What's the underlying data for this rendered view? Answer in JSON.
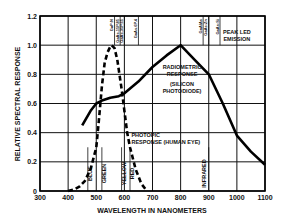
{
  "chart_data": {
    "type": "line",
    "title": "",
    "xlabel": "WAVELENGTH IN NANOMETERS",
    "ylabel": "RELATIVE SPECTRAL RESPONSE",
    "xlim": [
      300,
      1100
    ],
    "ylim": [
      0,
      1.2
    ],
    "xticks": [
      300,
      400,
      500,
      600,
      700,
      800,
      900,
      1000,
      1100
    ],
    "xtick_labels": [
      "300",
      "400",
      "500",
      "600",
      "700",
      "800",
      "900",
      "1000",
      "1100"
    ],
    "yticks": [
      0,
      0.2,
      0.4,
      0.6,
      0.8,
      1.0,
      1.2
    ],
    "ytick_labels": [
      "0",
      "0.2",
      "0.4",
      "0.6",
      "0.8",
      "1.0",
      "1.2"
    ],
    "grid": true,
    "series": [
      {
        "name": "PHOTOPIC RESPONSE (HUMAN EYE)",
        "style": "dashed",
        "x": [
          400,
          420,
          440,
          460,
          480,
          500,
          510,
          520,
          530,
          540,
          550,
          555,
          565,
          575,
          590,
          600,
          610,
          620,
          640,
          660,
          680
        ],
        "y": [
          0.0,
          0.01,
          0.03,
          0.07,
          0.15,
          0.3,
          0.5,
          0.72,
          0.88,
          0.95,
          0.99,
          1.0,
          0.98,
          0.9,
          0.7,
          0.55,
          0.4,
          0.3,
          0.15,
          0.05,
          0.0
        ]
      },
      {
        "name": "RADIOMETRIC RESPONSE (SILICON PHOTODIODE)",
        "style": "solid",
        "x": [
          450,
          480,
          500,
          520,
          550,
          580,
          600,
          650,
          700,
          750,
          800,
          850,
          900,
          950,
          1000,
          1050,
          1100
        ],
        "y": [
          0.45,
          0.55,
          0.6,
          0.62,
          0.64,
          0.65,
          0.67,
          0.75,
          0.85,
          0.93,
          1.0,
          0.9,
          0.8,
          0.6,
          0.38,
          0.27,
          0.18
        ]
      }
    ],
    "annotations": [
      {
        "text": "RADIOMETRIC",
        "x": 805,
        "y": 0.84
      },
      {
        "text": "RESPONSE",
        "x": 805,
        "y": 0.79
      },
      {
        "text": "(SILICON",
        "x": 805,
        "y": 0.72
      },
      {
        "text": "PHOTODIODE)",
        "x": 805,
        "y": 0.67
      },
      {
        "text": "PHOTOPIC",
        "x": 625,
        "y": 0.37
      },
      {
        "text": "RESPONSE (HUMAN EYE)",
        "x": 625,
        "y": 0.32
      },
      {
        "text": "PEAK LED",
        "x": 1000,
        "y": 1.08
      },
      {
        "text": "EMISSION",
        "x": 1000,
        "y": 1.03
      }
    ],
    "color_bands": [
      {
        "label": "BLUE",
        "line_at": 470
      },
      {
        "label": "GREEN",
        "line_at": 520
      },
      {
        "label": "YELLOW",
        "line_at": 590
      },
      {
        "label": "RED",
        "line_at": 620
      },
      {
        "label": "INFRARED",
        "line_at": 900
      }
    ],
    "led_markers": [
      {
        "label": "GaP:N",
        "x": 565
      },
      {
        "label": "GaAs.15P.85",
        "x": 585
      },
      {
        "label": "GaAs.35P.65",
        "x": 600
      },
      {
        "label": "GaAs.6P.4",
        "x": 650
      },
      {
        "label": "GaAlAs",
        "x": 880
      },
      {
        "label": "GaAs:Zn",
        "x": 900
      },
      {
        "label": "GaAs:Si",
        "x": 940
      }
    ]
  }
}
